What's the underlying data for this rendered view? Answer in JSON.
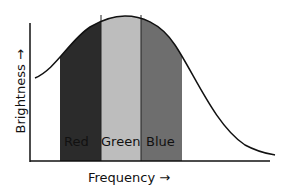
{
  "diagram": {
    "ylabel": "Brightness →",
    "xlabel": "Frequency →",
    "bands": [
      {
        "label": "Red",
        "color": "#2b2b2b"
      },
      {
        "label": "Green",
        "color": "#bdbdbd"
      },
      {
        "label": "Blue",
        "color": "#6e6e6e"
      }
    ]
  }
}
